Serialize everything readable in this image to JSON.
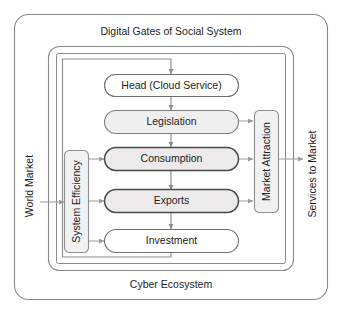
{
  "diagram": {
    "title": "Digital Gates of Social System",
    "footer": "Cyber Ecosystem",
    "left_outer_label": "World Market",
    "right_outer_label": "Services to Market",
    "left_inner_label": "System Efficiency",
    "right_inner_label": "Market Attraction",
    "nodes": [
      {
        "id": "head",
        "label": "Head (Cloud Service)",
        "style": "plain"
      },
      {
        "id": "legislation",
        "label": "Legislation",
        "style": "light"
      },
      {
        "id": "consumption",
        "label": "Consumption",
        "style": "strong"
      },
      {
        "id": "exports",
        "label": "Exports",
        "style": "strong"
      },
      {
        "id": "investment",
        "label": "Investment",
        "style": "plain"
      }
    ],
    "flow_order": [
      "Head (Cloud Service)",
      "Legislation",
      "Consumption",
      "Exports",
      "Investment"
    ],
    "edges": [
      {
        "from": "Digital Gates of Social System",
        "to": "Head (Cloud Service)"
      },
      {
        "from": "Head (Cloud Service)",
        "to": "Legislation"
      },
      {
        "from": "Legislation",
        "to": "Consumption"
      },
      {
        "from": "Consumption",
        "to": "Exports"
      },
      {
        "from": "Exports",
        "to": "Investment"
      },
      {
        "from": "Legislation",
        "to": "Market Attraction"
      },
      {
        "from": "Consumption",
        "to": "Market Attraction"
      },
      {
        "from": "Exports",
        "to": "Market Attraction"
      },
      {
        "from": "Market Attraction",
        "to": "Services to Market"
      },
      {
        "from": "World Market",
        "to": "System Efficiency"
      },
      {
        "from": "System Efficiency",
        "to": "Consumption"
      },
      {
        "from": "System Efficiency",
        "to": "Exports"
      },
      {
        "from": "System Efficiency",
        "to": "Investment"
      },
      {
        "from": "Investment",
        "to": "Head (Cloud Service)"
      }
    ],
    "colors": {
      "background": "#ffffff",
      "frame_stroke": "#8a8a8a",
      "connector": "#8d8d8d",
      "node_strong_stroke": "#4a4a4a",
      "node_fill": "#eceaea",
      "text": "#1d1d1d"
    }
  }
}
